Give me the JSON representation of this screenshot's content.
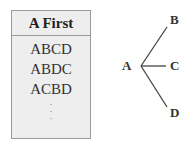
{
  "table": {
    "header": "A First",
    "rows": [
      "ABCD",
      "ABDC",
      "ACBD"
    ],
    "ellipsis": [
      "·",
      "·",
      "·"
    ]
  },
  "tree": {
    "root": "A",
    "children": [
      "B",
      "C",
      "D"
    ]
  }
}
